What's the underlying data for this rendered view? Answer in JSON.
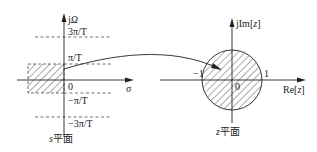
{
  "s_plane": {
    "imag_axis_label_prefix": "j",
    "imag_axis_label_symbol": "Ω",
    "real_axis_label": "σ",
    "origin_label": "0",
    "tick_3pi": "3π/T",
    "tick_pi": "π/T",
    "tick_neg_pi": "−π/T",
    "tick_neg_3pi": "−3π/T",
    "caption_var": "s",
    "caption_text": "平面"
  },
  "z_plane": {
    "imag_axis_label_prefix": "jIm[",
    "imag_axis_label_var": "z",
    "imag_axis_label_suffix": "]",
    "real_axis_label_prefix": "Re[",
    "real_axis_label_var": "z",
    "real_axis_label_suffix": "]",
    "origin_label": "0",
    "neg_one_label": "−1",
    "one_label": "1",
    "caption_var": "z",
    "caption_text": "平面"
  },
  "colors": {
    "line": "#222222",
    "hatch": "#333333"
  }
}
